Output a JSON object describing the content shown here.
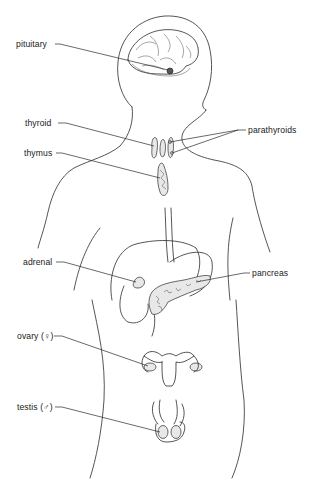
{
  "diagram": {
    "labels": {
      "pituitary": "pituitary",
      "thyroid": "thyroid",
      "parathyroids": "parathyroids",
      "thymus": "thymus",
      "adrenal": "adrenal",
      "pancreas": "pancreas",
      "ovary": "ovary (♀)",
      "testis": "testis (♂)"
    }
  }
}
